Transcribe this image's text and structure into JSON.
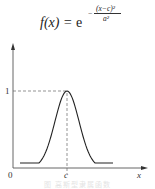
{
  "formula": {
    "lhs": "f(x) = ",
    "base": "e",
    "exponent_sign": "−",
    "exponent_numerator": "(x−c)²",
    "exponent_denominator": "a²"
  },
  "axes": {
    "y_tick_label": "1",
    "origin_label": "0",
    "x_tick_label": "c",
    "x_axis_label": "x"
  },
  "caption": "图 高斯型隶属函数",
  "chart_data": {
    "type": "line",
    "xlabel": "x",
    "ylabel": "",
    "x_ticks": [
      "0",
      "c"
    ],
    "y_ticks": [
      "1"
    ],
    "series": [
      {
        "name": "Gaussian membership function",
        "x": [
          -3,
          -2.5,
          -2,
          -1.5,
          -1,
          -0.5,
          0,
          0.5,
          1,
          1.5,
          2,
          2.5,
          3
        ],
        "x_note": "x expressed as (x - c)/a",
        "values": [
          0.0001,
          0.0019,
          0.0183,
          0.1054,
          0.3679,
          0.7788,
          1.0,
          0.7788,
          0.3679,
          0.1054,
          0.0183,
          0.0019,
          0.0001
        ]
      }
    ],
    "annotations": [
      "dashed horizontal line at y = 1 from y-axis to peak",
      "dashed vertical line at x = c from peak to x-axis"
    ],
    "ylim": [
      0,
      1.4
    ],
    "grid": false
  }
}
